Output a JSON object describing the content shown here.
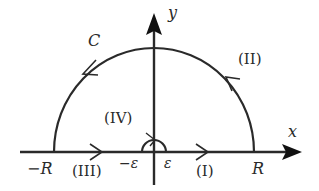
{
  "diagram": {
    "type": "contour-integral-indented-semicircle",
    "stroke_color": "#2a2a2a",
    "background": "#ffffff",
    "axes": {
      "x_label": "x",
      "y_label": "y"
    },
    "contour_label": "C",
    "segments": [
      {
        "id": "I",
        "label": "(I)",
        "description": "segment from ε to R along x-axis",
        "direction": "right"
      },
      {
        "id": "II",
        "label": "(II)",
        "description": "large semicircle of radius R",
        "direction": "counterclockwise"
      },
      {
        "id": "III",
        "label": "(III)",
        "description": "segment from -R to -ε along x-axis",
        "direction": "right"
      },
      {
        "id": "IV",
        "label": "(IV)",
        "description": "small semicircle of radius ε around origin",
        "direction": "clockwise"
      }
    ],
    "ticks": {
      "neg_R": "−R",
      "neg_eps": "−ε",
      "eps": "ε",
      "R": "R"
    }
  }
}
